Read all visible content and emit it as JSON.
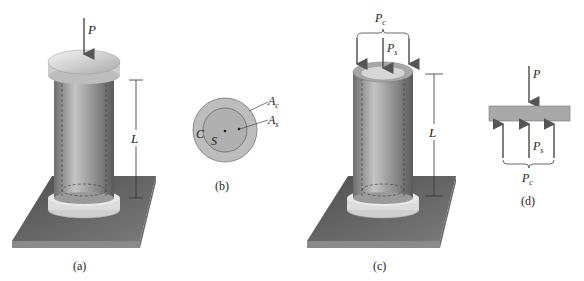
{
  "figure": {
    "panel_a": {
      "caption": "(a)",
      "load_label": "P",
      "length_label": "L"
    },
    "panel_b": {
      "caption": "(b)",
      "outer_label": "C",
      "inner_label": "S",
      "area_outer_label": "A",
      "area_outer_sub": "c",
      "area_inner_label": "A",
      "area_inner_sub": "s"
    },
    "panel_c": {
      "caption": "(c)",
      "tube_load_label": "P",
      "tube_load_sub": "c",
      "solid_load_label": "P",
      "solid_load_sub": "s",
      "length_label": "L"
    },
    "panel_d": {
      "caption": "(d)",
      "load_label": "P",
      "solid_reaction_label": "P",
      "solid_reaction_sub": "s",
      "tube_reaction_label": "P",
      "tube_reaction_sub": "c"
    }
  },
  "colors": {
    "base_plate": "#5f5f5f",
    "cylinder": "#9a9a9a",
    "cap": "#d8d8d8",
    "cross_section": "#b8b8b8",
    "arrow": "#555555"
  }
}
